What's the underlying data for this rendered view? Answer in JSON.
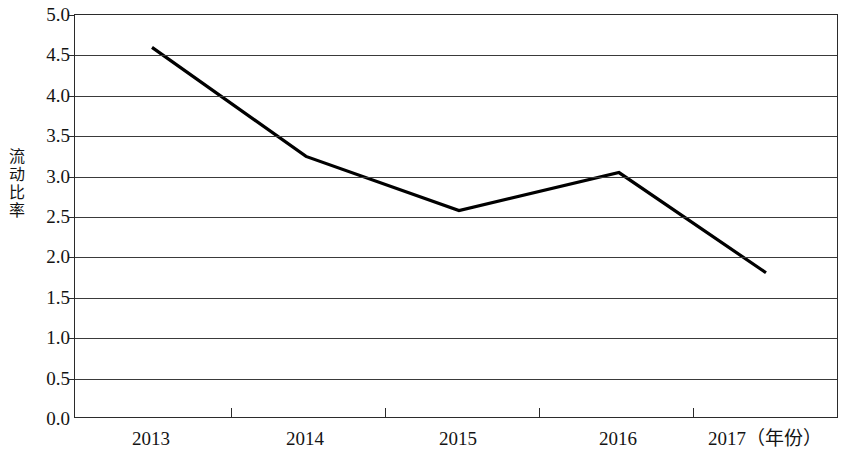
{
  "chart_data": {
    "type": "line",
    "title": "",
    "xlabel": "年份",
    "ylabel": "流动比率",
    "x_axis_unit_label": "（年份）",
    "categories": [
      "2013",
      "2014",
      "2015",
      "2016",
      "2017"
    ],
    "values": [
      4.6,
      3.25,
      2.58,
      3.05,
      1.81
    ],
    "series": [
      {
        "name": "流动比率",
        "values": [
          4.6,
          3.25,
          2.58,
          3.05,
          1.81
        ]
      }
    ],
    "ylim": [
      0.0,
      5.0
    ],
    "y_tick_step": 0.5,
    "y_tick_labels": [
      "5.0",
      "4.5",
      "4.0",
      "3.5",
      "3.0",
      "2.5",
      "2.0",
      "1.5",
      "1.0",
      "0.5",
      "0.0"
    ],
    "x_tick_labels": [
      "2013",
      "2014",
      "2015",
      "2016",
      "2017（年份）"
    ],
    "grid": true,
    "grid_axis": "y",
    "legend": false,
    "legend_position": "none",
    "markers": false,
    "line_color": "#000000",
    "grid_color": "#3a3a3a",
    "axis_color": "#2b2b2b",
    "background_color": "#ffffff"
  },
  "axis": {
    "y_title_chars": "流\n动\n比\n率"
  }
}
